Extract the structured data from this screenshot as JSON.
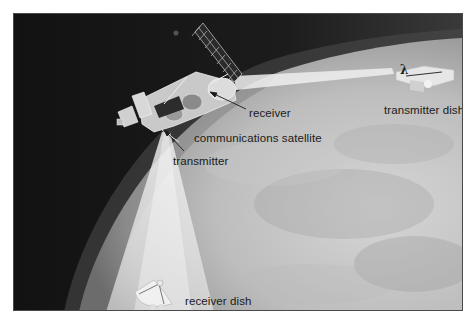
{
  "diagram": {
    "labels": {
      "receiver": "receiver",
      "communications_satellite": "communications satellite",
      "transmitter": "transmitter",
      "transmitter_dish": "transmitter dish",
      "receiver_dish": "receiver dish"
    },
    "symbols": {
      "wavelength": "λ"
    },
    "colors": {
      "space": "#151515",
      "planet_light": "#d4d4d4",
      "planet_mid": "#a8a8a8",
      "beam": "#ececec",
      "frame_border": "#4a4a4a",
      "text": "#1a1a1a"
    }
  }
}
